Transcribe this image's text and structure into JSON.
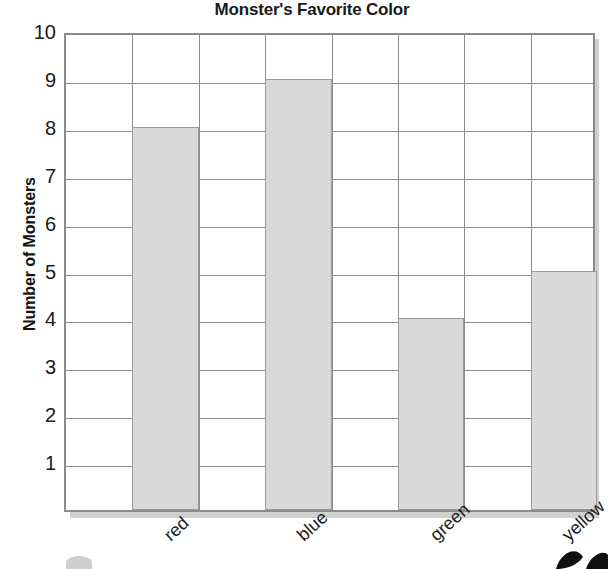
{
  "chart_data": {
    "type": "bar",
    "title": "Monster's Favorite Color",
    "xlabel": "",
    "ylabel": "Number of Monsters",
    "categories": [
      "red",
      "blue",
      "green",
      "yellow"
    ],
    "values": [
      8,
      9,
      4,
      5
    ],
    "ylim": [
      0,
      10
    ],
    "ytick_labels": [
      "10",
      "9",
      "8",
      "7",
      "6",
      "5",
      "4",
      "3",
      "2",
      "1"
    ],
    "ytick_values": [
      10,
      9,
      8,
      7,
      6,
      5,
      4,
      3,
      2,
      1
    ],
    "grid": true,
    "grid_columns": 8,
    "legend": "none",
    "bar_color": "#d9d9d9",
    "bar_border_color": "#9a9a9a",
    "grid_color": "#8d8d8d",
    "frame_color": "#8b8b8b",
    "text_color": "#1a1a1a"
  },
  "decor": {
    "leaf_label": "leaf-artwork",
    "blob_label": "blob-artwork"
  }
}
